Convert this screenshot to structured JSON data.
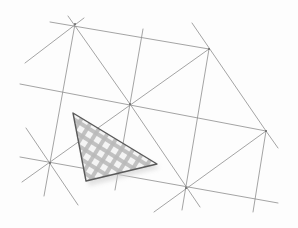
{
  "image": {
    "description": "Pencil sketch of a triangular lattice with one checker-patterned shaded triangle",
    "background": "#fdfdfd",
    "line_color": "#8a8a8a",
    "shade_color": "#b5b5b5",
    "outline_color": "#5a5a5a"
  },
  "lattice": {
    "vertices": [
      {
        "id": "top",
        "x": 75,
        "y": 24
      },
      {
        "id": "upper-right",
        "x": 209,
        "y": 49
      },
      {
        "id": "center",
        "x": 130,
        "y": 104
      },
      {
        "id": "right",
        "x": 266,
        "y": 131
      },
      {
        "id": "left",
        "x": 50,
        "y": 163
      },
      {
        "id": "lower-center",
        "x": 186,
        "y": 188
      }
    ]
  },
  "shaded_triangle": {
    "points": [
      [
        73,
        113
      ],
      [
        157,
        164
      ],
      [
        86,
        181
      ]
    ]
  }
}
